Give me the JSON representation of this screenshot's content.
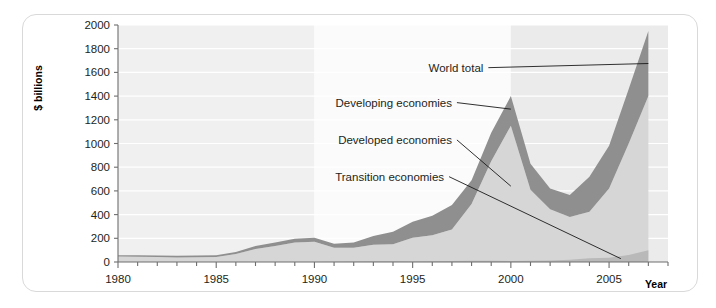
{
  "chart_data": {
    "type": "area",
    "title": "",
    "xlabel": "Year",
    "ylabel": "$ billions",
    "xlim": [
      1980,
      2008
    ],
    "ylim": [
      0,
      2000
    ],
    "grid": true,
    "legend_position": "inline-annotations",
    "x_tick_labels": [
      "1980",
      "1985",
      "1990",
      "1995",
      "2000",
      "2005"
    ],
    "x_tick_values": [
      1980,
      1985,
      1990,
      1995,
      2000,
      2005
    ],
    "x_minor_tick_step": 1,
    "y_tick_labels": [
      "0",
      "200",
      "400",
      "600",
      "800",
      "1000",
      "1200",
      "1400",
      "1600",
      "1800",
      "2000"
    ],
    "y_tick_values": [
      0,
      200,
      400,
      600,
      800,
      1000,
      1200,
      1400,
      1600,
      1800,
      2000
    ],
    "background_bands": [
      {
        "from": 1980,
        "to": 1990,
        "shade": "#f0f0f0"
      },
      {
        "from": 1990,
        "to": 2000,
        "shade": "#fbfbfb"
      },
      {
        "from": 2000,
        "to": 2008,
        "shade": "#ebebeb"
      }
    ],
    "annotations": [
      {
        "label": "World total",
        "x": 1998.6,
        "y": 1640
      },
      {
        "label": "Developing economies",
        "x": 1997.0,
        "y": 1345
      },
      {
        "label": "Developed economies",
        "x": 1997.0,
        "y": 1030
      },
      {
        "label": "Transition economies",
        "x": 1996.6,
        "y": 720
      }
    ],
    "x": [
      1980,
      1981,
      1982,
      1983,
      1984,
      1985,
      1986,
      1987,
      1988,
      1989,
      1990,
      1991,
      1992,
      1993,
      1994,
      1995,
      1996,
      1997,
      1998,
      1999,
      2000,
      2001,
      2002,
      2003,
      2004,
      2005,
      2006,
      2007
    ],
    "series": [
      {
        "name": "World total",
        "values": [
          57,
          56,
          55,
          52,
          54,
          56,
          85,
          135,
          165,
          197,
          205,
          155,
          165,
          220,
          255,
          340,
          390,
          480,
          690,
          1090,
          1400,
          830,
          620,
          565,
          720,
          980,
          1460,
          1950
        ]
      },
      {
        "name": "Developed economies",
        "values": [
          47,
          45,
          43,
          39,
          41,
          42,
          67,
          110,
          135,
          165,
          170,
          120,
          120,
          145,
          150,
          205,
          225,
          275,
          490,
          850,
          1150,
          610,
          445,
          380,
          425,
          620,
          1000,
          1400
        ]
      },
      {
        "name": "Transition economies",
        "values": [
          0,
          0,
          0,
          0,
          0,
          0,
          0,
          0,
          0,
          1,
          1,
          2,
          4,
          6,
          6,
          5,
          6,
          8,
          10,
          10,
          9,
          11,
          12,
          20,
          32,
          36,
          60,
          100
        ]
      }
    ]
  },
  "axis": {
    "y_title": "$ billions",
    "x_title": "Year"
  },
  "colors": {
    "band_fill": "#8f8f8f",
    "lower_fill": "#d6d6d6",
    "transition_fill": "#b9b9b9",
    "axis": "#6e6e6e",
    "gridline": "#ffffff",
    "frame": "#d9d9d9",
    "text": "#231f20"
  }
}
